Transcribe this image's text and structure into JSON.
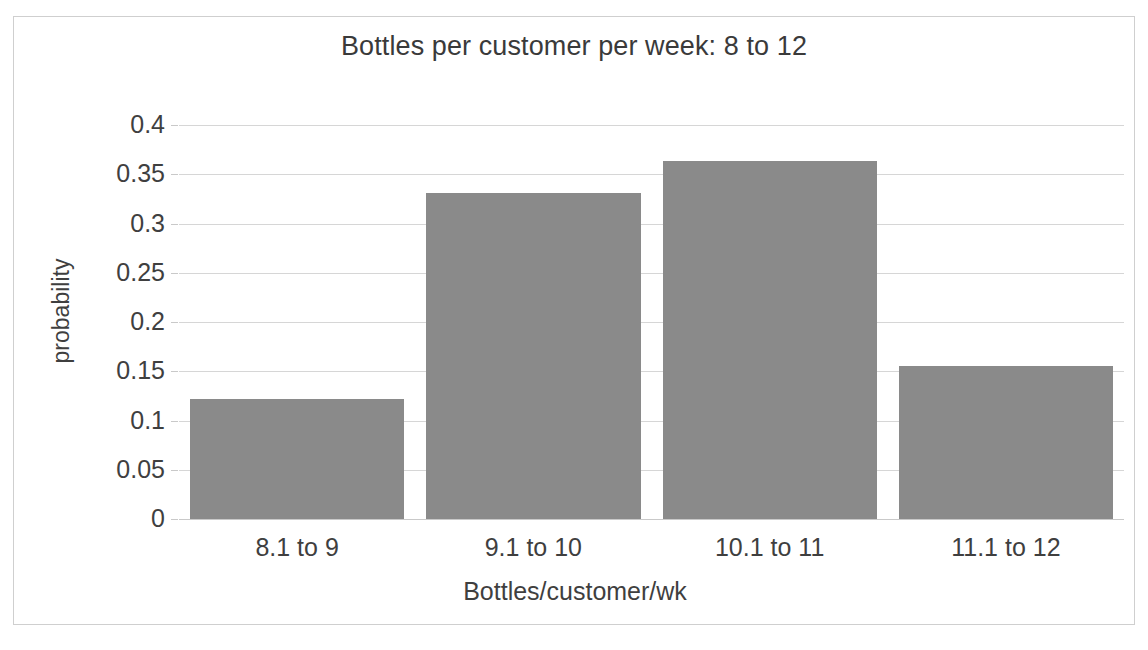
{
  "chart_data": {
    "type": "bar",
    "title": "Bottles per customer per week:  8 to 12",
    "xlabel": "Bottles/customer/wk",
    "ylabel": "probability",
    "categories": [
      "8.1 to 9",
      "9.1 to 10",
      "10.1 to 11",
      "11.1 to 12"
    ],
    "values": [
      0.122,
      0.331,
      0.363,
      0.155
    ],
    "ylim": [
      0,
      0.4
    ],
    "yticks": [
      0,
      0.05,
      0.1,
      0.15,
      0.2,
      0.25,
      0.3,
      0.35,
      0.4
    ],
    "ytick_labels": [
      "0",
      "0.05",
      "0.1",
      "0.15",
      "0.2",
      "0.25",
      "0.3",
      "0.35",
      "0.4"
    ],
    "grid": "horizontal",
    "legend": "none",
    "series": [
      {
        "name": "probability",
        "values": [
          0.122,
          0.331,
          0.363,
          0.155
        ],
        "color": "#8a8a8a"
      }
    ],
    "colors": {
      "bar_fill": "#8a8a8a",
      "gridline": "#d6d6d6",
      "text": "#3f3f3f",
      "frame": "#cfcfcf",
      "background": "#ffffff"
    }
  }
}
